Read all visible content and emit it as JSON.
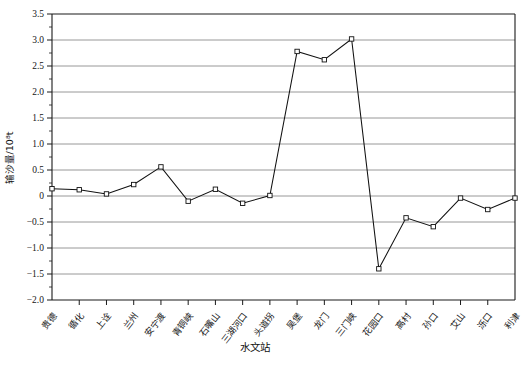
{
  "chart_data": {
    "type": "line",
    "title": "",
    "subtitle": "",
    "xlabel": "水文站",
    "ylabel": "输沙量/10⁸t",
    "ylim": [
      -2.0,
      3.5
    ],
    "grid": true,
    "legend": null,
    "marker": "open-square",
    "categories": [
      "贵德",
      "循化",
      "上诠",
      "兰州",
      "安宁渡",
      "青铜峡",
      "石嘴山",
      "三湖河口",
      "头道拐",
      "吴堡",
      "龙门",
      "三门峡",
      "花园口",
      "高村",
      "孙口",
      "艾山",
      "泺口",
      "利津"
    ],
    "values": [
      0.14,
      0.12,
      0.04,
      0.22,
      0.56,
      -0.1,
      0.13,
      -0.14,
      0.01,
      2.78,
      2.62,
      3.02,
      -1.4,
      -0.42,
      -0.59,
      -0.04,
      -0.26,
      -0.04
    ],
    "ytick_labels": [
      "3.5",
      "3.0",
      "2.5",
      "2.0",
      "1.5",
      "1.0",
      "0.5",
      "0",
      "-0.5",
      "-1.0",
      "-1.5",
      "-2.0"
    ],
    "ytick_values": [
      3.5,
      3.0,
      2.5,
      2.0,
      1.5,
      1.0,
      0.5,
      0,
      -0.5,
      -1.0,
      -1.5,
      -2.0
    ],
    "series": [
      {
        "name": "输沙量",
        "values": [
          0.14,
          0.12,
          0.04,
          0.22,
          0.56,
          -0.1,
          0.13,
          -0.14,
          0.01,
          2.78,
          2.62,
          3.02,
          -1.4,
          -0.42,
          -0.59,
          -0.04,
          -0.26,
          -0.04
        ]
      }
    ],
    "colors": {
      "line": "#111111",
      "marker_fill": "#ffffff",
      "marker_stroke": "#111111",
      "grid": "#8c8c8c",
      "axis": "#1a1a1a",
      "background": "#ffffff"
    }
  }
}
